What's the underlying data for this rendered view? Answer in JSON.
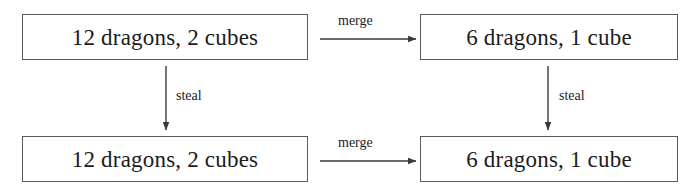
{
  "diagram": {
    "type": "commutative-diagram",
    "colors": {
      "background": "#ffffff",
      "box_border": "#5a5a5a",
      "text": "#1c1c1c",
      "arrow": "#3a3a3a"
    },
    "nodes": [
      {
        "id": "top-left",
        "label": "12 dragons, 2 cubes"
      },
      {
        "id": "top-right",
        "label": "6 dragons, 1 cube"
      },
      {
        "id": "bottom-left",
        "label": "12 dragons, 2 cubes"
      },
      {
        "id": "bottom-right",
        "label": "6 dragons, 1 cube"
      }
    ],
    "edges": [
      {
        "id": "merge-top",
        "label": "merge",
        "from": "top-left",
        "to": "top-right",
        "direction": "right"
      },
      {
        "id": "merge-bottom",
        "label": "merge",
        "from": "bottom-left",
        "to": "bottom-right",
        "direction": "right"
      },
      {
        "id": "steal-left",
        "label": "steal",
        "from": "top-left",
        "to": "bottom-left",
        "direction": "down"
      },
      {
        "id": "steal-right",
        "label": "steal",
        "from": "top-right",
        "to": "bottom-right",
        "direction": "down"
      }
    ]
  }
}
